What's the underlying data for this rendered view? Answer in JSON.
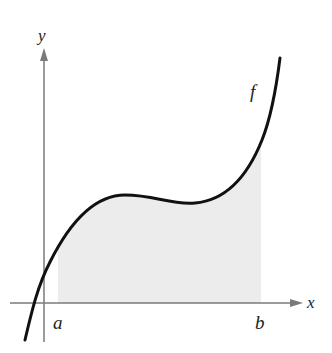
{
  "figure": {
    "type": "area-under-curve",
    "labels": {
      "x_axis": "x",
      "y_axis": "y",
      "function": "f",
      "lower_bound": "a",
      "upper_bound": "b"
    },
    "colors": {
      "curve": "#111111",
      "axes": "#7a7a7a",
      "shading": "#ececec",
      "background": "#ffffff"
    },
    "curve_shape": "cubic-like: rises, local maximum, local minimum, then rises steeply"
  }
}
